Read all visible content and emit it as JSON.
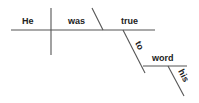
{
  "diagram": {
    "type": "sentence-diagram",
    "sentence": "He was true to his word",
    "words": {
      "subject": "He",
      "verb": "was",
      "predicate_adjective": "true",
      "preposition": "to",
      "object_of_preposition": "word",
      "modifier": "his"
    },
    "colors": {
      "line": "#555555",
      "text": "#222222",
      "background": "#ffffff"
    }
  }
}
